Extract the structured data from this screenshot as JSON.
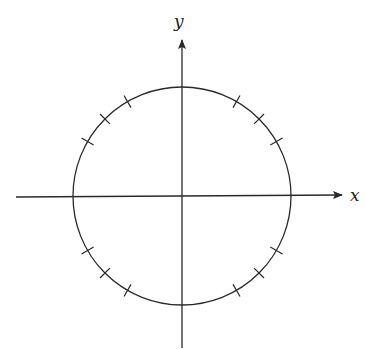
{
  "diagram": {
    "axes": {
      "x_label": "x",
      "y_label": "y"
    },
    "circle": {
      "cx": 182,
      "cy": 196,
      "r": 109
    },
    "tick_angles_deg": [
      30,
      45,
      60,
      120,
      135,
      150,
      210,
      225,
      240,
      300,
      315,
      330
    ],
    "colors": {
      "stroke": "#2a2a2a",
      "background": "#ffffff"
    }
  }
}
